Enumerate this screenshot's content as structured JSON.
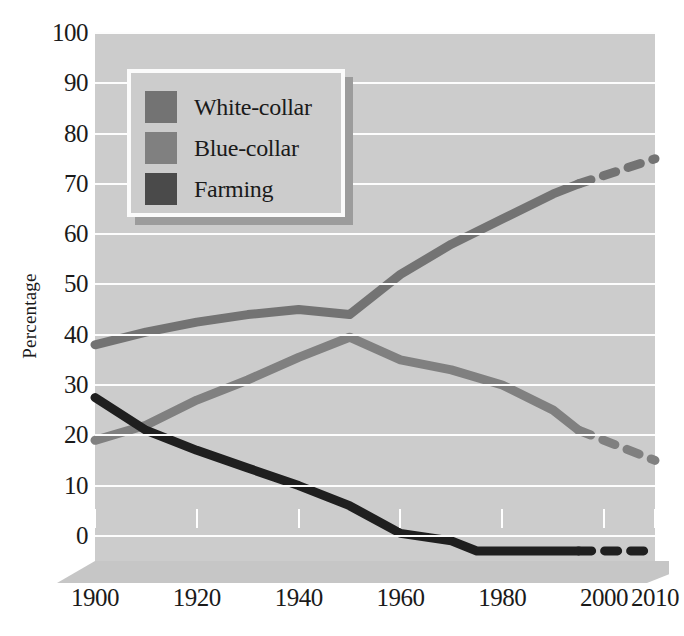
{
  "chart_data": {
    "type": "line",
    "title": "",
    "subtitle": "",
    "xlabel": "",
    "ylabel": "Percentage",
    "xlim": [
      1900,
      2010
    ],
    "ylim": [
      -5,
      100
    ],
    "yticks": [
      0,
      10,
      20,
      30,
      40,
      50,
      60,
      70,
      80,
      90,
      100
    ],
    "xticks": [
      1900,
      1920,
      1940,
      1960,
      1980,
      2000,
      2010
    ],
    "xtick_labels": [
      "1900",
      "1920",
      "1940",
      "1960",
      "1980",
      "2000",
      "2010"
    ],
    "ytick_labels": [
      "0",
      "10",
      "20",
      "30",
      "40",
      "50",
      "60",
      "70",
      "80",
      "90",
      "100"
    ],
    "grid": "horizontal",
    "legend_position": "upper-left",
    "series": [
      {
        "name": "White-collar",
        "color": "#737373",
        "style": "solid",
        "x": [
          1900,
          1910,
          1920,
          1930,
          1940,
          1950,
          1960,
          1970,
          1980,
          1990,
          1995
        ],
        "values": [
          38,
          40.5,
          42.5,
          44,
          45,
          44,
          52,
          58,
          63,
          68,
          70
        ],
        "projection": {
          "style": "dashed",
          "x": [
            1995,
            2010
          ],
          "values": [
            70,
            75
          ]
        }
      },
      {
        "name": "Blue-collar",
        "color": "#808080",
        "style": "solid",
        "x": [
          1900,
          1910,
          1920,
          1930,
          1940,
          1950,
          1960,
          1970,
          1980,
          1990,
          1995
        ],
        "values": [
          19,
          22,
          27,
          31,
          35.5,
          39.5,
          35,
          33,
          30,
          25,
          21
        ],
        "projection": {
          "style": "dashed",
          "x": [
            1995,
            2010
          ],
          "values": [
            21,
            15
          ]
        }
      },
      {
        "name": "Farming",
        "color": "#1f1f1f",
        "style": "solid",
        "x": [
          1900,
          1910,
          1920,
          1930,
          1940,
          1950,
          1960,
          1970,
          1975,
          1995
        ],
        "values": [
          27.5,
          21,
          17,
          13.5,
          10,
          6,
          0.5,
          -1,
          -3,
          -3
        ],
        "projection": {
          "style": "dashed",
          "x": [
            1995,
            2010
          ],
          "values": [
            -3,
            -3
          ]
        }
      }
    ]
  },
  "legend": {
    "items": [
      {
        "label": "White-collar",
        "color": "#737373"
      },
      {
        "label": "Blue-collar",
        "color": "#808080"
      },
      {
        "label": "Farming",
        "color": "#4a4a4a"
      }
    ]
  },
  "colors": {
    "plot_background": "#cccccc",
    "gridline": "#fdfdfd",
    "page_background": "#ffffff",
    "text": "#1a1a1a",
    "base_slab": "#c6c6c6",
    "legend_shadow": "#9c9c9c"
  }
}
